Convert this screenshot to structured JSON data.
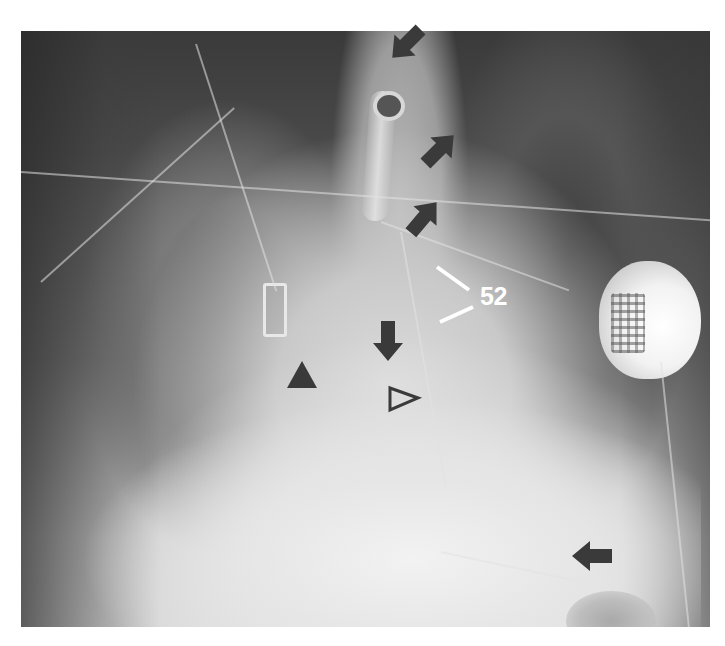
{
  "image": {
    "type": "radiograph",
    "description": "Frontal chest radiograph with annotation markers",
    "background_color": "#ffffff",
    "marker_color": "#3a3a3a",
    "label_color": "#ffffff"
  },
  "annotations": {
    "label": {
      "text": "52",
      "leader_lines": 2
    },
    "arrows": [
      {
        "id": "arrow-top",
        "direction": "down-right",
        "x": 405,
        "y": 45
      },
      {
        "id": "arrow-upper-right",
        "direction": "up-left",
        "x": 440,
        "y": 140
      },
      {
        "id": "arrow-mid",
        "direction": "up-left",
        "x": 425,
        "y": 210
      },
      {
        "id": "arrow-down",
        "direction": "down",
        "x": 388,
        "y": 345
      },
      {
        "id": "arrow-bottom-right",
        "direction": "left",
        "x": 590,
        "y": 555
      }
    ],
    "arrowheads": [
      {
        "id": "arrowhead-filled",
        "style": "filled",
        "x": 302,
        "y": 375
      },
      {
        "id": "arrowhead-open",
        "style": "open",
        "x": 403,
        "y": 398
      }
    ]
  }
}
